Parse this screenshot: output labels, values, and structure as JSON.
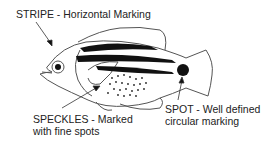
{
  "diagram": {
    "labels": {
      "stripe": {
        "line1": "STRIPE - Horizontal Marking"
      },
      "speckles": {
        "line1": "SPECKLES - Marked",
        "line2": "with fine spots"
      },
      "spot": {
        "line1": "SPOT - Well defined",
        "line2": "circular marking"
      }
    },
    "colors": {
      "ink": "#111111",
      "outline": "#555555",
      "background": "#ffffff"
    }
  }
}
